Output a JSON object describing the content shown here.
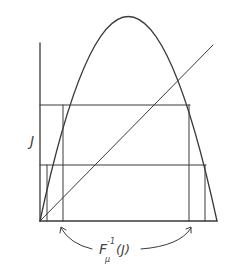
{
  "diagram": {
    "type": "logistic-map-preimage-sketch",
    "y_axis_label": "J",
    "bottom_label": {
      "base": "F",
      "subscript": "μ",
      "superscript": "-1",
      "argument": "(J)"
    },
    "elements": [
      "vertical axis",
      "horizontal baseline",
      "parabola (inverted, hump-shaped)",
      "diagonal line y = x",
      "upper horizontal level line",
      "lower horizontal level line",
      "vertical drop lines from parabola intersections",
      "two curved arrows pointing to preimage interval endpoints"
    ],
    "colors": {
      "ink": "#3a3a3a",
      "background": "#ffffff"
    }
  }
}
